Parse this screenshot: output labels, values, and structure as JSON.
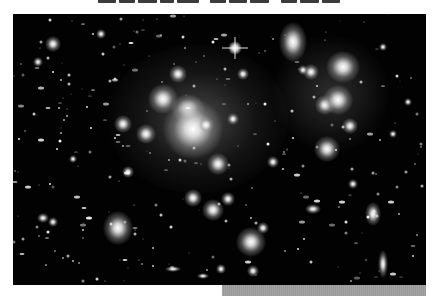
{
  "page": {
    "title_visible": false,
    "title_note": "clipped heading text at top edge, unreadable"
  },
  "photo": {
    "subject": "galaxy cluster deep-field astronomical photograph",
    "colors": {
      "background": "#020202",
      "glow": "#ffffff"
    },
    "galaxies": [
      {
        "x": 40,
        "y": 208,
        "w": 10,
        "h": 10
      },
      {
        "x": 150,
        "y": 85,
        "w": 30,
        "h": 30
      },
      {
        "x": 175,
        "y": 95,
        "w": 34,
        "h": 30
      },
      {
        "x": 165,
        "y": 60,
        "w": 18,
        "h": 18
      },
      {
        "x": 180,
        "y": 115,
        "w": 60,
        "h": 60
      },
      {
        "x": 193,
        "y": 111,
        "w": 16,
        "h": 16
      },
      {
        "x": 220,
        "y": 105,
        "w": 12,
        "h": 12
      },
      {
        "x": 205,
        "y": 150,
        "w": 22,
        "h": 22
      },
      {
        "x": 133,
        "y": 120,
        "w": 20,
        "h": 20
      },
      {
        "x": 110,
        "y": 110,
        "w": 18,
        "h": 18
      },
      {
        "x": 230,
        "y": 60,
        "w": 12,
        "h": 12
      },
      {
        "x": 280,
        "y": 28,
        "w": 28,
        "h": 40
      },
      {
        "x": 298,
        "y": 58,
        "w": 16,
        "h": 16
      },
      {
        "x": 330,
        "y": 53,
        "w": 34,
        "h": 32
      },
      {
        "x": 312,
        "y": 91,
        "w": 20,
        "h": 20
      },
      {
        "x": 325,
        "y": 86,
        "w": 30,
        "h": 30
      },
      {
        "x": 314,
        "y": 135,
        "w": 26,
        "h": 26
      },
      {
        "x": 337,
        "y": 112,
        "w": 16,
        "h": 16
      },
      {
        "x": 290,
        "y": 56,
        "w": 10,
        "h": 10
      },
      {
        "x": 370,
        "y": 33,
        "w": 8,
        "h": 8
      },
      {
        "x": 105,
        "y": 214,
        "w": 30,
        "h": 34
      },
      {
        "x": 30,
        "y": 204,
        "w": 12,
        "h": 10
      },
      {
        "x": 200,
        "y": 196,
        "w": 22,
        "h": 22
      },
      {
        "x": 180,
        "y": 184,
        "w": 18,
        "h": 18
      },
      {
        "x": 215,
        "y": 185,
        "w": 14,
        "h": 14
      },
      {
        "x": 238,
        "y": 228,
        "w": 30,
        "h": 30
      },
      {
        "x": 250,
        "y": 214,
        "w": 12,
        "h": 12
      },
      {
        "x": 300,
        "y": 195,
        "w": 16,
        "h": 10
      },
      {
        "x": 360,
        "y": 200,
        "w": 16,
        "h": 24
      },
      {
        "x": 370,
        "y": 250,
        "w": 10,
        "h": 28
      },
      {
        "x": 240,
        "y": 257,
        "w": 12,
        "h": 12
      },
      {
        "x": 208,
        "y": 255,
        "w": 10,
        "h": 10
      },
      {
        "x": 115,
        "y": 158,
        "w": 12,
        "h": 12
      },
      {
        "x": 60,
        "y": 145,
        "w": 8,
        "h": 8
      },
      {
        "x": 88,
        "y": 20,
        "w": 10,
        "h": 10
      },
      {
        "x": 40,
        "y": 30,
        "w": 16,
        "h": 16
      },
      {
        "x": 25,
        "y": 48,
        "w": 10,
        "h": 10
      },
      {
        "x": 160,
        "y": 255,
        "w": 16,
        "h": 6
      },
      {
        "x": 190,
        "y": 262,
        "w": 12,
        "h": 6
      },
      {
        "x": 260,
        "y": 148,
        "w": 12,
        "h": 12
      },
      {
        "x": 340,
        "y": 170,
        "w": 10,
        "h": 10
      },
      {
        "x": 395,
        "y": 88,
        "w": 8,
        "h": 8
      },
      {
        "x": 380,
        "y": 120,
        "w": 8,
        "h": 8
      }
    ],
    "bright_star": {
      "x": 222,
      "y": 34
    }
  },
  "footer": {
    "bar_color": "#a0a0a0"
  }
}
